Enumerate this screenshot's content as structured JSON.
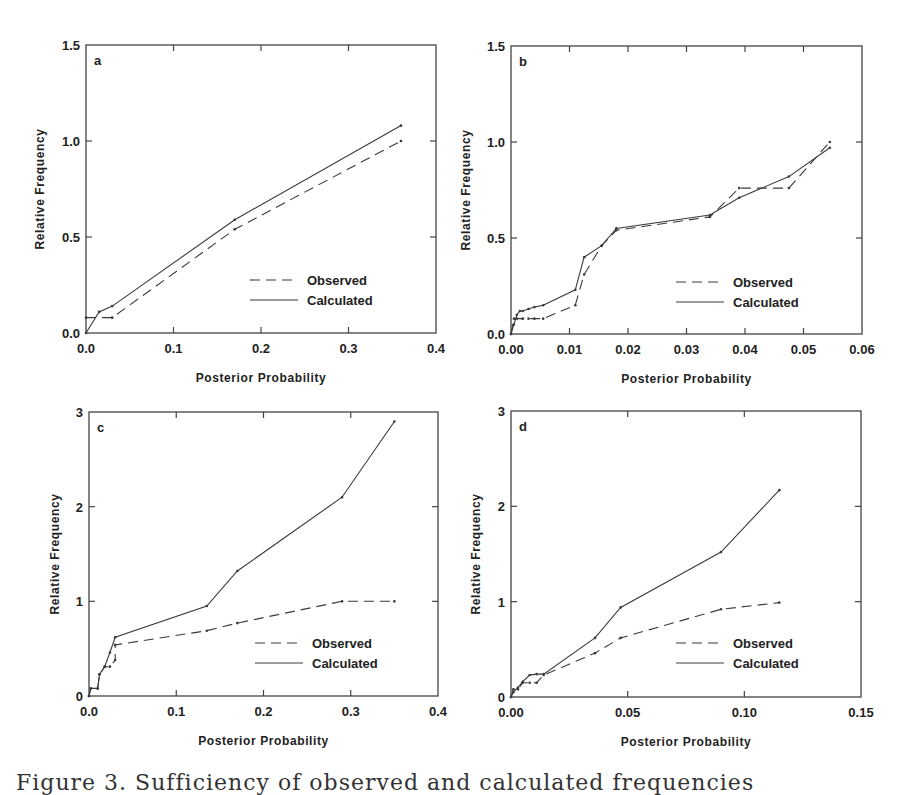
{
  "caption": "Figure 3. Sufficiency of observed and calculated frequencies",
  "legend": {
    "observed": "Observed",
    "calculated": "Calculated"
  },
  "colors": {
    "line": "#3a3a3a",
    "axis": "#444444",
    "text": "#222222"
  },
  "chart_data": [
    {
      "type": "line",
      "panel": "a",
      "title": "a",
      "xlabel": "Posterior Probability",
      "ylabel": "Relative Frequency",
      "xlim": [
        0,
        0.4
      ],
      "ylim": [
        0,
        1.5
      ],
      "xticks": [
        "0.0",
        "0.1",
        "0.2",
        "0.3",
        "0.4"
      ],
      "yticks": [
        "0.0",
        "0.5",
        "1.0",
        "1.5"
      ],
      "legend_position": "lower right",
      "series": [
        {
          "name": "Observed",
          "style": "dashed",
          "x": [
            0.0,
            0.03,
            0.17,
            0.36
          ],
          "y": [
            0.08,
            0.08,
            0.54,
            1.0
          ]
        },
        {
          "name": "Calculated",
          "style": "solid",
          "x": [
            0.0,
            0.015,
            0.03,
            0.17,
            0.36
          ],
          "y": [
            0.0,
            0.11,
            0.14,
            0.59,
            1.08
          ]
        }
      ]
    },
    {
      "type": "line",
      "panel": "b",
      "title": "b",
      "xlabel": "Posterior Probability",
      "ylabel": "Relative Frequency",
      "xlim": [
        0,
        0.06
      ],
      "ylim": [
        0,
        1.5
      ],
      "xticks": [
        "0.00",
        "0.01",
        "0.02",
        "0.03",
        "0.04",
        "0.05",
        "0.06"
      ],
      "yticks": [
        "0.0",
        "0.5",
        "1.0",
        "1.5"
      ],
      "legend_position": "lower right",
      "series": [
        {
          "name": "Observed",
          "style": "dashed",
          "x": [
            0.0,
            0.0005,
            0.001,
            0.002,
            0.003,
            0.004,
            0.0055,
            0.011,
            0.0125,
            0.0155,
            0.018,
            0.034,
            0.039,
            0.0475,
            0.0545
          ],
          "y": [
            0.0,
            0.08,
            0.08,
            0.08,
            0.08,
            0.08,
            0.08,
            0.15,
            0.31,
            0.46,
            0.54,
            0.61,
            0.76,
            0.76,
            1.0
          ]
        },
        {
          "name": "Calculated",
          "style": "solid",
          "x": [
            0.0,
            0.0005,
            0.001,
            0.0015,
            0.002,
            0.003,
            0.004,
            0.0055,
            0.011,
            0.0125,
            0.0155,
            0.018,
            0.034,
            0.039,
            0.0475,
            0.0545
          ],
          "y": [
            0.0,
            0.05,
            0.1,
            0.12,
            0.12,
            0.13,
            0.14,
            0.15,
            0.23,
            0.4,
            0.46,
            0.55,
            0.62,
            0.71,
            0.82,
            0.97
          ]
        }
      ]
    },
    {
      "type": "line",
      "panel": "c",
      "title": "c",
      "xlabel": "Posterior Probability",
      "ylabel": "Relative Frequency",
      "xlim": [
        0,
        0.4
      ],
      "ylim": [
        0,
        3
      ],
      "xticks": [
        "0.0",
        "0.1",
        "0.2",
        "0.3",
        "0.4"
      ],
      "yticks": [
        "0",
        "1",
        "2",
        "3"
      ],
      "legend_position": "lower right",
      "series": [
        {
          "name": "Observed",
          "style": "dashed",
          "x": [
            0.0,
            0.002,
            0.01,
            0.012,
            0.018,
            0.024,
            0.03,
            0.03,
            0.135,
            0.17,
            0.29,
            0.35
          ],
          "y": [
            0.0,
            0.08,
            0.08,
            0.23,
            0.31,
            0.31,
            0.38,
            0.54,
            0.69,
            0.77,
            1.0,
            1.0
          ]
        },
        {
          "name": "Calculated",
          "style": "solid",
          "x": [
            0.0,
            0.002,
            0.01,
            0.012,
            0.018,
            0.024,
            0.03,
            0.135,
            0.17,
            0.29,
            0.35
          ],
          "y": [
            0.0,
            0.08,
            0.08,
            0.23,
            0.31,
            0.46,
            0.62,
            0.95,
            1.32,
            2.1,
            2.9
          ]
        }
      ]
    },
    {
      "type": "line",
      "panel": "d",
      "title": "d",
      "xlabel": "Posterior Probability",
      "ylabel": "Relative Frequency",
      "xlim": [
        0,
        0.15
      ],
      "ylim": [
        0,
        3
      ],
      "xticks": [
        "0.00",
        "0.05",
        "0.10",
        "0.15"
      ],
      "yticks": [
        "0",
        "1",
        "2",
        "3"
      ],
      "legend_position": "lower right",
      "series": [
        {
          "name": "Observed",
          "style": "dashed",
          "x": [
            0.0,
            0.001,
            0.003,
            0.005,
            0.008,
            0.011,
            0.014,
            0.036,
            0.047,
            0.09,
            0.115
          ],
          "y": [
            0.0,
            0.08,
            0.08,
            0.15,
            0.15,
            0.15,
            0.23,
            0.46,
            0.62,
            0.92,
            0.99
          ]
        },
        {
          "name": "Calculated",
          "style": "solid",
          "x": [
            0.0,
            0.001,
            0.003,
            0.005,
            0.008,
            0.011,
            0.014,
            0.036,
            0.047,
            0.09,
            0.115
          ],
          "y": [
            0.0,
            0.05,
            0.1,
            0.16,
            0.23,
            0.24,
            0.24,
            0.62,
            0.94,
            1.52,
            2.17
          ]
        }
      ]
    }
  ]
}
